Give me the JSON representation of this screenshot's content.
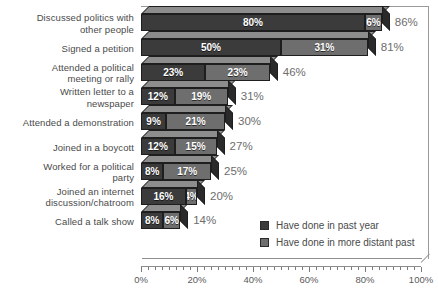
{
  "chart_data": {
    "type": "bar",
    "orientation": "horizontal",
    "stacked": true,
    "title": "",
    "xlabel": "",
    "ylabel": "",
    "xlim": [
      0,
      100
    ],
    "xticks": [
      "0%",
      "20%",
      "40%",
      "60%",
      "80%",
      "100%"
    ],
    "grid": false,
    "legend_position": "right-middle",
    "categories": [
      "Discussed politics with other people",
      "Signed a petition",
      "Attended a political meeting or rally",
      "Written letter to a newspaper",
      "Attended a demonstration",
      "Joined in a boycott",
      "Worked for a political party",
      "Joined an internet discussion/chatroom",
      "Called a talk show"
    ],
    "series": [
      {
        "name": "Have done in past year",
        "color": "#3b3b3b",
        "values": [
          80,
          50,
          23,
          12,
          9,
          12,
          8,
          16,
          8
        ],
        "labels": [
          "80%",
          "50%",
          "23%",
          "12%",
          "9%",
          "12%",
          "8%",
          "16%",
          "8%"
        ]
      },
      {
        "name": "Have done in more distant past",
        "color": "#6e6e6e",
        "values": [
          6,
          31,
          23,
          19,
          21,
          15,
          17,
          4,
          6
        ],
        "labels": [
          "6%",
          "31%",
          "23%",
          "19%",
          "21%",
          "15%",
          "17%",
          "4%",
          "6%"
        ]
      }
    ],
    "totals": [
      86,
      81,
      46,
      31,
      30,
      27,
      25,
      20,
      14
    ],
    "total_labels": [
      "86%",
      "81%",
      "46%",
      "31%",
      "30%",
      "27%",
      "25%",
      "20%",
      "14%"
    ]
  },
  "legend": {
    "items": [
      {
        "label": "Have done in past year",
        "color": "#3b3b3b"
      },
      {
        "label": "Have done in more distant past",
        "color": "#6e6e6e"
      }
    ]
  },
  "axis": {
    "ticks": [
      "0%",
      "20%",
      "40%",
      "60%",
      "80%",
      "100%"
    ]
  }
}
